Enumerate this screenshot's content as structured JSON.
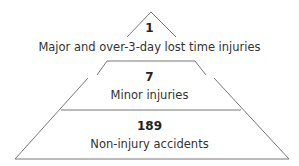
{
  "diagram": {
    "type": "pyramid",
    "tiers": [
      {
        "value": "1",
        "label": "Major and over-3-day lost time injuries"
      },
      {
        "value": "7",
        "label": "Minor injuries"
      },
      {
        "value": "189",
        "label": "Non-injury accidents"
      }
    ],
    "line_color": "#777777"
  }
}
